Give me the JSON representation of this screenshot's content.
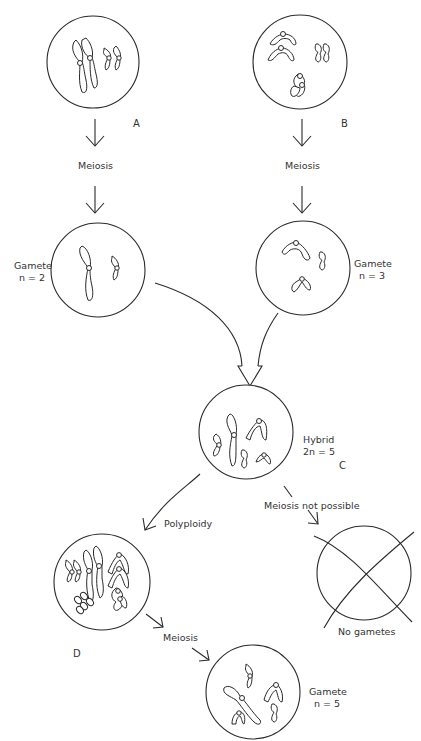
{
  "diagram": {
    "type": "speciation-by-polyploidy",
    "nodes": {
      "A": {
        "letter": "A",
        "description": "parent cell A, 2 chromosome pairs"
      },
      "B": {
        "letter": "B",
        "description": "parent cell B, 3 chromosome pairs"
      },
      "gamete_a": {
        "label_line1": "Gamete",
        "label_line2": "n = 2"
      },
      "gamete_b": {
        "label_line1": "Gamete",
        "label_line2": "n = 3"
      },
      "C": {
        "letter": "C",
        "label_line1": "Hybrid",
        "label_line2": "2n = 5"
      },
      "no_gametes": {
        "label": "No gametes"
      },
      "D": {
        "letter": "D"
      },
      "gamete_d": {
        "label_line1": "Gamete",
        "label_line2": "n = 5"
      }
    },
    "edges": {
      "a_meiosis": "Meiosis",
      "b_meiosis": "Meiosis",
      "polyploidy": "Polyploidy",
      "meiosis_not_possible": "Meiosis not possible",
      "d_meiosis": "Meiosis"
    },
    "colors": {
      "line": "#2a2a2a",
      "text": "#333333",
      "background": "#ffffff"
    }
  }
}
